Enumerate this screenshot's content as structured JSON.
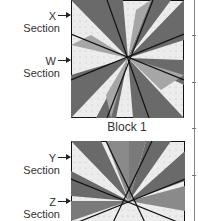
{
  "block1": {
    "caption": "Block 1",
    "labels": [
      {
        "letter": "X",
        "word": "Section"
      },
      {
        "letter": "W",
        "word": "Section"
      }
    ]
  },
  "block2": {
    "caption": "",
    "labels": [
      {
        "letter": "Y",
        "word": "Section"
      },
      {
        "letter": "Z",
        "word": "Section"
      }
    ]
  },
  "colors": {
    "dark": "#666666",
    "medium": "#9a9a9a",
    "light": "#c4c4c4",
    "background": "#ececec",
    "line": "#111111"
  }
}
